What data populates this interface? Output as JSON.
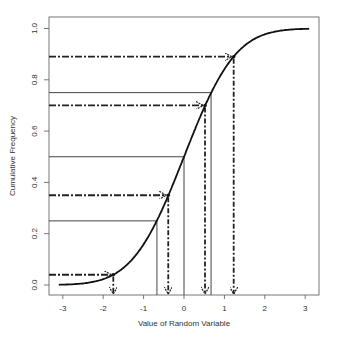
{
  "chart_data": {
    "type": "line",
    "title": "",
    "xlabel": "Value of Random Variable",
    "ylabel": "Cumulative Frequency",
    "xlim": [
      -3.2,
      3.35
    ],
    "ylim": [
      -0.04,
      1.05
    ],
    "x_ticks": [
      -3,
      -2,
      -1,
      0,
      1,
      2,
      3
    ],
    "x_tick_labels": [
      "-3",
      "-2",
      "-1",
      "0",
      "1",
      "2",
      "3"
    ],
    "y_ticks": [
      0.0,
      0.2,
      0.4,
      0.6,
      0.8,
      1.0
    ],
    "y_tick_labels": [
      "0.0",
      "0.2",
      "0.4",
      "0.6",
      "0.8",
      "1.0"
    ],
    "grid": false,
    "legend": null,
    "series": [
      {
        "name": "Normal CDF",
        "style": "solid-thick",
        "x_range": [
          -3.1,
          3.1
        ],
        "function": "standard normal cumulative distribution"
      }
    ],
    "quantile_lines_solid": [
      {
        "p": 0.25,
        "x": -0.67
      },
      {
        "p": 0.5,
        "x": 0.0
      },
      {
        "p": 0.75,
        "x": 0.67
      }
    ],
    "sample_arrows_dashdot": [
      {
        "p": 0.04,
        "x": -1.75
      },
      {
        "p": 0.35,
        "x": -0.39
      },
      {
        "p": 0.7,
        "x": 0.52
      },
      {
        "p": 0.89,
        "x": 1.23
      }
    ]
  },
  "colors": {
    "curve": "#111111",
    "solid_lines": "#444444",
    "arrows": "#222222",
    "axis": "#555555",
    "text": "#333333"
  }
}
